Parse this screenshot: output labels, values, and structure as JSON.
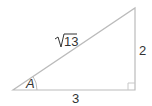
{
  "diagram": {
    "type": "right-triangle",
    "stroke_color": "#bbbbbb",
    "text_color": "#333333",
    "vertices": {
      "angle_vertex": [
        13,
        90
      ],
      "right_angle_vertex": [
        135,
        90
      ],
      "top_vertex": [
        135,
        8
      ]
    },
    "labels": {
      "hypotenuse_radical": "√",
      "hypotenuse_radicand": "13",
      "vertical_side": "2",
      "horizontal_side": "3",
      "angle": "A"
    },
    "right_angle_marker": true,
    "angle_arc": true
  }
}
